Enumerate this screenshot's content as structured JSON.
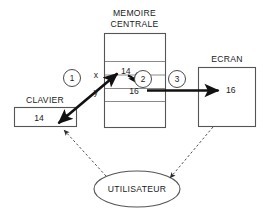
{
  "diagram": {
    "title_hidden": "",
    "nodes": {
      "keyboard": {
        "label": "CLAVIER",
        "value": "14"
      },
      "memory": {
        "label_line1": "MEMOIRE",
        "label_line2": "CENTRALE",
        "var_x": "x",
        "var_y": "y",
        "value_x": "14",
        "value_y": "16"
      },
      "screen": {
        "label": "ECRAN",
        "value": "16"
      },
      "user": {
        "label": "UTILISATEUR"
      }
    },
    "steps": {
      "one": "1",
      "two": "2",
      "three": "3"
    },
    "colors": {
      "box_stroke": "#555555",
      "divider": "#8a8a8a",
      "arrow": "#111111",
      "dashed": "#3b3b3b",
      "text": "#1a1a1a",
      "background": "#ffffff"
    }
  }
}
